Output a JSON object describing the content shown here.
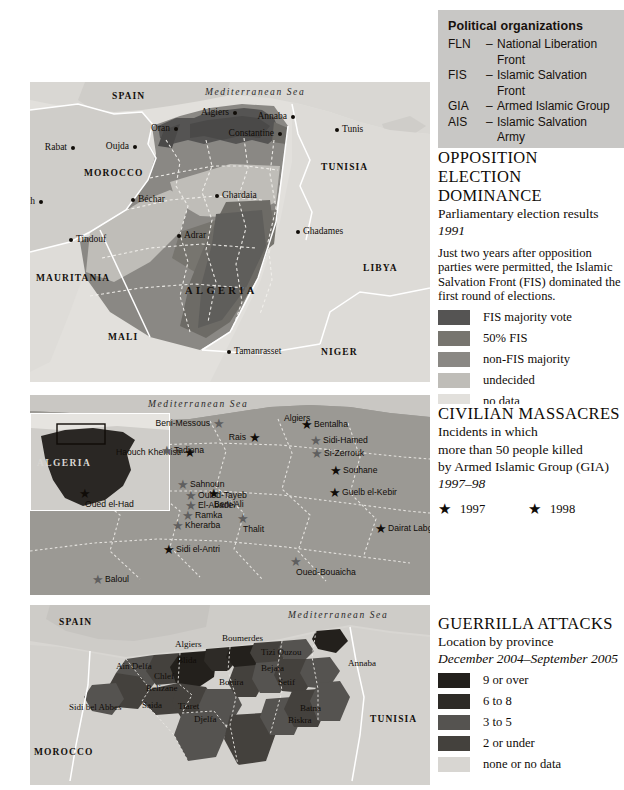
{
  "organizations": {
    "title": "Political organizations",
    "items": [
      {
        "abbr": "FLN",
        "dash": "–",
        "name": "National Liberation Front"
      },
      {
        "abbr": "FIS",
        "dash": "–",
        "name": "Islamic Salvation Front"
      },
      {
        "abbr": "GIA",
        "dash": "–",
        "name": "Armed Islamic Group"
      },
      {
        "abbr": "AIS",
        "dash": "–",
        "name": "Islamic Salvation Army"
      },
      {
        "abbr": "GSPC",
        "dash": "–",
        "name": "Salafist Group for Preaching"
      }
    ],
    "continuation": "and Combat"
  },
  "panel1": {
    "title_line1": "OPPOSITION ELECTION",
    "title_line2": "DOMINANCE",
    "subtitle": "Parliamentary election results",
    "subtitle_year": "1991",
    "blurb": "Just two years after opposition parties were permitted, the Islamic Salvation Front (FIS) dominated the first round of elections.",
    "legend": [
      {
        "label": "FIS majority vote",
        "color": "#555453"
      },
      {
        "label": "50% FIS",
        "color": "#77756f"
      },
      {
        "label": "non-FIS majority",
        "color": "#8a8884"
      },
      {
        "label": "undecided",
        "color": "#bfbdb8"
      },
      {
        "label": "no data",
        "color": "#e2e0dc"
      }
    ]
  },
  "panel2": {
    "title": "CIVILIAN MASSACRES",
    "line1": "Incidents in which",
    "line2": "more than 50 people killed",
    "line3": "by Armed Islamic Group (GIA)",
    "years": "1997–98",
    "legend": [
      {
        "label": "1997",
        "marker": "star",
        "color": "#100c08"
      },
      {
        "label": "1998",
        "marker": "star",
        "color": "#100c08"
      }
    ]
  },
  "panel3": {
    "title": "GUERRILLA ATTACKS",
    "subtitle": "Location by province",
    "period": "December 2004–September 2005",
    "legend": [
      {
        "label": "9 or over",
        "color": "#23201c"
      },
      {
        "label": "6 to 8",
        "color": "#2e2b27"
      },
      {
        "label": "3 to 5",
        "color": "#555350"
      },
      {
        "label": "2 or under",
        "color": "#44413d"
      },
      {
        "label": "none or no data",
        "color": "#d8d6d2"
      }
    ]
  },
  "map1": {
    "sea": "Mediterranean Sea",
    "countries": [
      {
        "name": "SPAIN",
        "x": 82,
        "y": 9,
        "size": "small"
      },
      {
        "name": "MOROCCO",
        "x": 54,
        "y": 86,
        "size": "small"
      },
      {
        "name": "TUNISIA",
        "x": 291,
        "y": 80,
        "size": "small"
      },
      {
        "name": "LIBYA",
        "x": 333,
        "y": 181,
        "size": "small"
      },
      {
        "name": "MAURITANIA",
        "x": 6,
        "y": 191,
        "size": "small"
      },
      {
        "name": "MALI",
        "x": 78,
        "y": 250,
        "size": "small"
      },
      {
        "name": "NIGER",
        "x": 291,
        "y": 265,
        "size": "small"
      },
      {
        "name": "ALGERIA",
        "x": 155,
        "y": 203,
        "size": "big"
      }
    ],
    "cities": [
      {
        "name": "Rabat",
        "x": 41,
        "y": 60,
        "anchor": "right"
      },
      {
        "name": "Marrakech",
        "x": 9,
        "y": 114,
        "anchor": "right"
      },
      {
        "name": "Oujda",
        "x": 103,
        "y": 59,
        "anchor": "right"
      },
      {
        "name": "Oran",
        "x": 144,
        "y": 41,
        "anchor": "right"
      },
      {
        "name": "Algiers",
        "x": 203,
        "y": 25,
        "anchor": "right"
      },
      {
        "name": "Annaba",
        "x": 261,
        "y": 29,
        "anchor": "right"
      },
      {
        "name": "Tunis",
        "x": 305,
        "y": 42,
        "anchor": "left"
      },
      {
        "name": "Constantine",
        "x": 248,
        "y": 46,
        "anchor": "right"
      },
      {
        "name": "Béchar",
        "x": 101,
        "y": 112,
        "anchor": "left"
      },
      {
        "name": "Ghardaia",
        "x": 185,
        "y": 108,
        "anchor": "left"
      },
      {
        "name": "Ghadames",
        "x": 266,
        "y": 144,
        "anchor": "left"
      },
      {
        "name": "Tindouf",
        "x": 39,
        "y": 152,
        "anchor": "left"
      },
      {
        "name": "Adrar",
        "x": 147,
        "y": 148,
        "anchor": "left"
      },
      {
        "name": "Tamanrasset",
        "x": 197,
        "y": 264,
        "anchor": "left"
      }
    ]
  },
  "map2": {
    "sea": "Mediterranean Sea",
    "inset_label": "ALGERIA",
    "sites": [
      {
        "name": "Algiers",
        "x": 248,
        "y": 6,
        "year": null,
        "anchor": "center"
      },
      {
        "name": "Beni-Messous",
        "x": 183,
        "y": 22,
        "year": 1998,
        "anchor": "left"
      },
      {
        "name": "Bentalha",
        "x": 271,
        "y": 23,
        "year": 1997,
        "anchor": "right"
      },
      {
        "name": "Rais",
        "x": 219,
        "y": 36,
        "year": 1997,
        "anchor": "left"
      },
      {
        "name": "Sidi-Hamed",
        "x": 280,
        "y": 39,
        "year": 1998,
        "anchor": "right"
      },
      {
        "name": "Haouch Khemisti",
        "x": 154,
        "y": 51,
        "year": 1997,
        "anchor": "left"
      },
      {
        "name": "Si-Zerrouk",
        "x": 281,
        "y": 52,
        "year": 1998,
        "anchor": "right"
      },
      {
        "name": "Souhane",
        "x": 300,
        "y": 69,
        "year": 1997,
        "anchor": "right"
      },
      {
        "name": "Beni-Ali",
        "x": 178,
        "y": 92,
        "year": 1997,
        "anchor": "center"
      },
      {
        "name": "Guelb el-Kebir",
        "x": 299,
        "y": 91,
        "year": 1997,
        "anchor": "right"
      },
      {
        "name": "Oued el-Had",
        "x": 49,
        "y": 92,
        "year": 1997,
        "anchor": "center"
      },
      {
        "name": "Tadjena",
        "x": 131,
        "y": 49,
        "year": 1998,
        "anchor": "right"
      },
      {
        "name": "Sahnoun",
        "x": 147,
        "y": 83,
        "year": 1998,
        "anchor": "right"
      },
      {
        "name": "Ouled-Tayeb",
        "x": 155,
        "y": 94,
        "year": 1998,
        "anchor": "right"
      },
      {
        "name": "El-Abadel",
        "x": 155,
        "y": 104,
        "year": 1998,
        "anchor": "right"
      },
      {
        "name": "Ramka",
        "x": 152,
        "y": 114,
        "year": 1998,
        "anchor": "right"
      },
      {
        "name": "Kherarba",
        "x": 142,
        "y": 124,
        "year": 1998,
        "anchor": "right"
      },
      {
        "name": "Sidi el-Antri",
        "x": 133,
        "y": 148,
        "year": 1997,
        "anchor": "right"
      },
      {
        "name": "Baloul",
        "x": 62,
        "y": 178,
        "year": 1998,
        "anchor": "right"
      },
      {
        "name": "Thalit",
        "x": 207,
        "y": 117,
        "year": 1998,
        "anchor": "center"
      },
      {
        "name": "Oued-Bouaicha",
        "x": 260,
        "y": 160,
        "year": 1998,
        "anchor": "center"
      },
      {
        "name": "Dairat Labguer",
        "x": 345,
        "y": 127,
        "year": 1997,
        "anchor": "right"
      }
    ]
  },
  "map3": {
    "sea": "Mediterranean Sea",
    "countries": [
      {
        "name": "SPAIN",
        "x": 29,
        "y": 12
      },
      {
        "name": "MOROCCO",
        "x": 4,
        "y": 142
      },
      {
        "name": "TUNISIA",
        "x": 340,
        "y": 109
      }
    ],
    "provinces": [
      {
        "name": "Algiers",
        "x": 145,
        "y": 34,
        "rot": 0
      },
      {
        "name": "Boumerdes",
        "x": 192,
        "y": 28,
        "rot": 0
      },
      {
        "name": "Tizi Ouzou",
        "x": 231,
        "y": 42,
        "rot": 0
      },
      {
        "name": "Blida",
        "x": 147,
        "y": 50,
        "rot": 0
      },
      {
        "name": "Ain Delfa",
        "x": 86,
        "y": 56,
        "rot": 0
      },
      {
        "name": "Annaba",
        "x": 318,
        "y": 53,
        "rot": 0
      },
      {
        "name": "Chlef",
        "x": 124,
        "y": 66,
        "rot": 0
      },
      {
        "name": "Relizane",
        "x": 116,
        "y": 78,
        "rot": 0
      },
      {
        "name": "Bouira",
        "x": 189,
        "y": 72,
        "rot": 0
      },
      {
        "name": "Bejaia",
        "x": 231,
        "y": 58,
        "rot": 0
      },
      {
        "name": "Setif",
        "x": 248,
        "y": 72,
        "rot": 0
      },
      {
        "name": "Sidi bel Abbes",
        "x": 39,
        "y": 97,
        "rot": 0
      },
      {
        "name": "Saida",
        "x": 112,
        "y": 95,
        "rot": 0
      },
      {
        "name": "Tiaret",
        "x": 148,
        "y": 96,
        "rot": 0
      },
      {
        "name": "Djelfa",
        "x": 164,
        "y": 109,
        "rot": 0
      },
      {
        "name": "Batna",
        "x": 270,
        "y": 98,
        "rot": 0
      },
      {
        "name": "Biskra",
        "x": 258,
        "y": 110,
        "rot": 0
      }
    ]
  }
}
